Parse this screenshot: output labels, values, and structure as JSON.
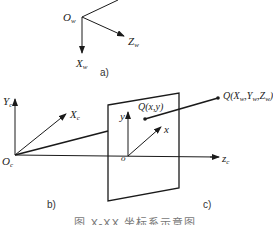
{
  "diagram": {
    "type": "coordinate-systems",
    "panels": {
      "a": {
        "tag": "a)",
        "origin_label": "O",
        "origin_sub": "w",
        "axes": [
          {
            "name": "Z",
            "sub": "w"
          },
          {
            "name": "X",
            "sub": "w"
          }
        ]
      },
      "b": {
        "tag": "b)",
        "origin_label": "O",
        "origin_sub": "c",
        "axes": [
          {
            "name": "Y",
            "sub": "c"
          },
          {
            "name": "X",
            "sub": "c"
          }
        ]
      },
      "c": {
        "tag": "c)",
        "origin_label": "o",
        "axes": [
          {
            "name": "y"
          },
          {
            "name": "x"
          },
          {
            "name": "z",
            "sub": "c"
          }
        ],
        "image_point_label": "Q(x,y)",
        "world_point_label": "Q(X",
        "world_point_parts": [
          "Q(X",
          "w",
          ",Y",
          "w",
          ",Z",
          "w",
          ")"
        ]
      }
    },
    "caption": "图 X-XX  坐标系示意图"
  },
  "colors": {
    "line": "#1a1a1a",
    "text": "#222222",
    "caption": "#777777"
  }
}
